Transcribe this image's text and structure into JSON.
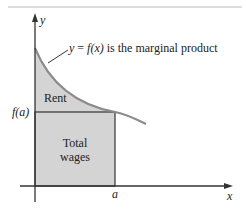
{
  "diagram": {
    "type": "area-under-curve",
    "curve_label": "y = f (x) is the marginal product",
    "curve_label_parts": {
      "lhs": "y",
      "eq": " = ",
      "f": "f",
      "arg": "(x)",
      "rest": " is the marginal product"
    },
    "regions": {
      "rent": {
        "label": "Rent",
        "fill": "#d4d4d4"
      },
      "wages": {
        "label_line1": "Total",
        "label_line2": "wages",
        "fill": "#d4d4d4"
      }
    },
    "axes": {
      "x_label": "x",
      "y_label": "y"
    },
    "ticks": {
      "x_tick": "a",
      "y_tick": "f(a)"
    },
    "colors": {
      "curve": "#8a8a8a",
      "axis": "#333333",
      "shade": "#d4d4d4",
      "rule": "#bbbbbb"
    }
  }
}
